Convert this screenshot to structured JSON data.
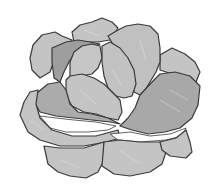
{
  "image": {
    "subject": "Lettuce head illustration",
    "style": "grayscale vector drawing",
    "colors": {
      "background": "#ffffff",
      "outline": "#3a3a3a",
      "leaf_light": "#c4c4c4",
      "leaf_mid": "#b3b3b3",
      "leaf_dark": "#9c9c9c",
      "vein": "#e6e6e6"
    }
  }
}
